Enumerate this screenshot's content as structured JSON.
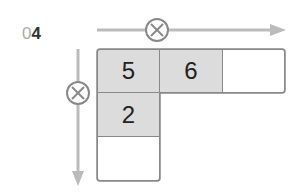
{
  "problem": {
    "prefix": "0",
    "number": "4"
  },
  "colors": {
    "shaded": "#dcdcdc",
    "border": "#888888",
    "arrow": "#bbbbbb",
    "circle": "#888888"
  },
  "operators": {
    "horizontal": "×",
    "vertical": "×"
  },
  "grid": {
    "row0": [
      "5",
      "6",
      ""
    ],
    "col0": [
      "5",
      "2",
      ""
    ]
  }
}
